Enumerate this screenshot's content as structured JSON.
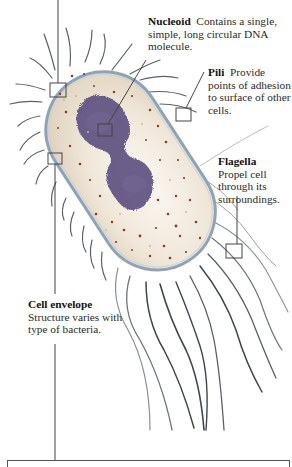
{
  "figure": {
    "colors": {
      "cytoplasm": "#ece4d6",
      "cell_wall": "#8ea2b8",
      "nucleoid": "#5c4f80",
      "ribosome_dots": "#8a3a2a",
      "appendages": "#3f4650",
      "leader_lines": "#444444"
    }
  },
  "labels": {
    "nucleoid": {
      "term": "Nucleoid",
      "description": "Contains a single, simple, long circular DNA molecule."
    },
    "pili": {
      "term": "Pili",
      "description": "Provide points of adhesion to surface of other cells."
    },
    "flagella": {
      "term": "Flagella",
      "description": "Propel cell through its surroundings."
    },
    "cell_envelope": {
      "term": "Cell envelope",
      "description": "Structure varies with type of bacteria."
    }
  }
}
